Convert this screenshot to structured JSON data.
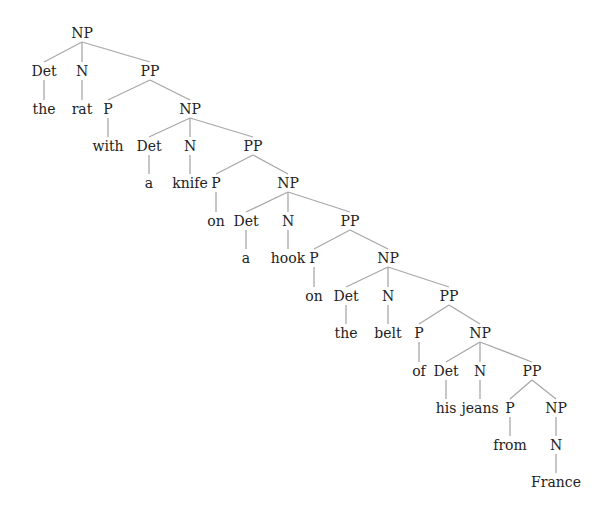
{
  "diagram": {
    "type": "syntax-tree",
    "phrase": "the rat with a knife on a hook on the belt of his jeans from France",
    "colors": {
      "text": "#222222",
      "edge": "#a8a8a8",
      "background": "#ffffff"
    },
    "nodes": [
      {
        "id": "n0",
        "label": "NP",
        "x": 82,
        "y": 33,
        "kind": "cat"
      },
      {
        "id": "n1",
        "label": "Det",
        "x": 44,
        "y": 71,
        "kind": "cat",
        "parent": "n0"
      },
      {
        "id": "n2",
        "label": "N",
        "x": 82,
        "y": 71,
        "kind": "cat",
        "parent": "n0"
      },
      {
        "id": "n3",
        "label": "PP",
        "x": 150,
        "y": 71,
        "kind": "cat",
        "parent": "n0"
      },
      {
        "id": "n4",
        "label": "the",
        "x": 44,
        "y": 109,
        "kind": "word",
        "parent": "n1"
      },
      {
        "id": "n5",
        "label": "rat",
        "x": 82,
        "y": 109,
        "kind": "word",
        "parent": "n2"
      },
      {
        "id": "n6",
        "label": "P",
        "x": 108,
        "y": 109,
        "kind": "cat",
        "parent": "n3"
      },
      {
        "id": "n7",
        "label": "NP",
        "x": 190,
        "y": 109,
        "kind": "cat",
        "parent": "n3"
      },
      {
        "id": "n8",
        "label": "with",
        "x": 108,
        "y": 146,
        "kind": "word",
        "parent": "n6"
      },
      {
        "id": "n9",
        "label": "Det",
        "x": 149,
        "y": 146,
        "kind": "cat",
        "parent": "n7"
      },
      {
        "id": "n10",
        "label": "N",
        "x": 190,
        "y": 146,
        "kind": "cat",
        "parent": "n7"
      },
      {
        "id": "n11",
        "label": "PP",
        "x": 253,
        "y": 146,
        "kind": "cat",
        "parent": "n7"
      },
      {
        "id": "n12",
        "label": "a",
        "x": 149,
        "y": 183,
        "kind": "word",
        "parent": "n9"
      },
      {
        "id": "n13",
        "label": "knife",
        "x": 190,
        "y": 183,
        "kind": "word",
        "parent": "n10"
      },
      {
        "id": "n14",
        "label": "P",
        "x": 216,
        "y": 183,
        "kind": "cat",
        "parent": "n11"
      },
      {
        "id": "n15",
        "label": "NP",
        "x": 288,
        "y": 183,
        "kind": "cat",
        "parent": "n11"
      },
      {
        "id": "n16",
        "label": "on",
        "x": 216,
        "y": 221,
        "kind": "word",
        "parent": "n14"
      },
      {
        "id": "n17",
        "label": "Det",
        "x": 246,
        "y": 221,
        "kind": "cat",
        "parent": "n15"
      },
      {
        "id": "n18",
        "label": "N",
        "x": 288,
        "y": 221,
        "kind": "cat",
        "parent": "n15"
      },
      {
        "id": "n19",
        "label": "PP",
        "x": 350,
        "y": 221,
        "kind": "cat",
        "parent": "n15"
      },
      {
        "id": "n20",
        "label": "a",
        "x": 246,
        "y": 258,
        "kind": "word",
        "parent": "n17"
      },
      {
        "id": "n21",
        "label": "hook",
        "x": 288,
        "y": 258,
        "kind": "word",
        "parent": "n18"
      },
      {
        "id": "n22",
        "label": "P",
        "x": 314,
        "y": 258,
        "kind": "cat",
        "parent": "n19"
      },
      {
        "id": "n23",
        "label": "NP",
        "x": 388,
        "y": 258,
        "kind": "cat",
        "parent": "n19"
      },
      {
        "id": "n24",
        "label": "on",
        "x": 314,
        "y": 296,
        "kind": "word",
        "parent": "n22"
      },
      {
        "id": "n25",
        "label": "Det",
        "x": 346,
        "y": 296,
        "kind": "cat",
        "parent": "n23"
      },
      {
        "id": "n26",
        "label": "N",
        "x": 388,
        "y": 296,
        "kind": "cat",
        "parent": "n23"
      },
      {
        "id": "n27",
        "label": "PP",
        "x": 449,
        "y": 296,
        "kind": "cat",
        "parent": "n23"
      },
      {
        "id": "n28",
        "label": "the",
        "x": 346,
        "y": 333,
        "kind": "word",
        "parent": "n25"
      },
      {
        "id": "n29",
        "label": "belt",
        "x": 388,
        "y": 333,
        "kind": "word",
        "parent": "n26"
      },
      {
        "id": "n30",
        "label": "P",
        "x": 419,
        "y": 333,
        "kind": "cat",
        "parent": "n27"
      },
      {
        "id": "n31",
        "label": "NP",
        "x": 480,
        "y": 333,
        "kind": "cat",
        "parent": "n27"
      },
      {
        "id": "n32",
        "label": "of",
        "x": 419,
        "y": 371,
        "kind": "word",
        "parent": "n30"
      },
      {
        "id": "n33",
        "label": "Det",
        "x": 446,
        "y": 371,
        "kind": "cat",
        "parent": "n31"
      },
      {
        "id": "n34",
        "label": "N",
        "x": 480,
        "y": 371,
        "kind": "cat",
        "parent": "n31"
      },
      {
        "id": "n35",
        "label": "PP",
        "x": 532,
        "y": 371,
        "kind": "cat",
        "parent": "n31"
      },
      {
        "id": "n36",
        "label": "his",
        "x": 446,
        "y": 408,
        "kind": "word",
        "parent": "n33"
      },
      {
        "id": "n37",
        "label": "jeans",
        "x": 480,
        "y": 408,
        "kind": "word",
        "parent": "n34"
      },
      {
        "id": "n38",
        "label": "P",
        "x": 510,
        "y": 408,
        "kind": "cat",
        "parent": "n35"
      },
      {
        "id": "n39",
        "label": "NP",
        "x": 556,
        "y": 408,
        "kind": "cat",
        "parent": "n35"
      },
      {
        "id": "n40",
        "label": "from",
        "x": 510,
        "y": 445,
        "kind": "word",
        "parent": "n38"
      },
      {
        "id": "n41",
        "label": "N",
        "x": 556,
        "y": 445,
        "kind": "cat",
        "parent": "n39"
      },
      {
        "id": "n42",
        "label": "France",
        "x": 556,
        "y": 482,
        "kind": "word",
        "parent": "n41"
      }
    ]
  }
}
